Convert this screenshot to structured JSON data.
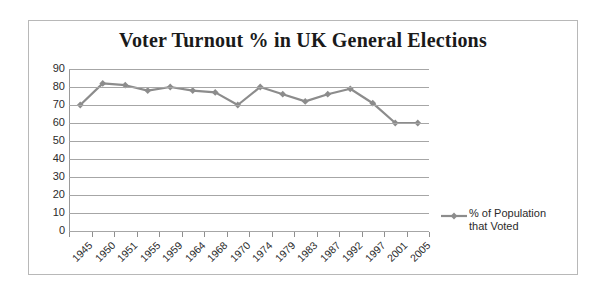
{
  "chart_data": {
    "type": "line",
    "title": "Voter Turnout % in UK General Elections",
    "xlabel": "",
    "ylabel": "",
    "ylim": [
      0,
      90
    ],
    "ytick_step": 10,
    "yticks": [
      90,
      80,
      70,
      60,
      50,
      40,
      30,
      20,
      10,
      0
    ],
    "grid": true,
    "legend_position": "right",
    "categories": [
      "1945",
      "1950",
      "1951",
      "1955",
      "1959",
      "1964",
      "1968",
      "1970",
      "1974",
      "1979",
      "1983",
      "1987",
      "1992",
      "1997",
      "2001",
      "2005"
    ],
    "series": [
      {
        "name": "% of Population that Voted",
        "values": [
          70,
          82,
          81,
          78,
          80,
          78,
          77,
          70,
          80,
          76,
          72,
          76,
          79,
          71,
          60,
          60
        ],
        "color": "#8c8c8c",
        "marker": "diamond"
      }
    ]
  },
  "legend": {
    "line1": "% of Population",
    "line2": "that Voted"
  },
  "colors": {
    "series": "#8c8c8c",
    "grid": "#a6a6a6",
    "axis": "#9a9a9a",
    "border": "#b8b8b8",
    "text": "#2b2b2b",
    "title": "#1a1a1a"
  }
}
